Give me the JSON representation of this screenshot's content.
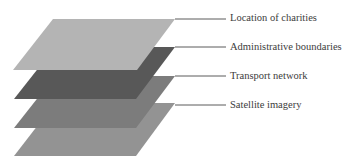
{
  "diagram": {
    "type": "layered-gis-stack",
    "layers": [
      {
        "label": "Location of charities",
        "color": "#b4b4b4",
        "order": 1
      },
      {
        "label": "Administrative boundaries",
        "color": "#585858",
        "order": 2
      },
      {
        "label": "Transport network",
        "color": "#7c7c7c",
        "order": 3
      },
      {
        "label": "Satellite imagery",
        "color": "#939393",
        "order": 4
      }
    ],
    "connector_color": "#5a5a5a"
  }
}
